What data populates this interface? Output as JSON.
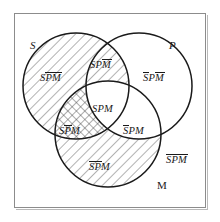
{
  "figure": {
    "type": "venn-diagram-3-set",
    "background_color": "#ffffff",
    "frame_color": "#8c8c8c",
    "stroke_color": "#1a1a1a",
    "hatch_color": "#555555"
  },
  "circles": [
    {
      "id": "S",
      "label": "S",
      "label_x": 30,
      "label_y": 40,
      "cx": 76,
      "cy": 86,
      "r": 53
    },
    {
      "id": "P",
      "label": "P",
      "label_x": 169,
      "label_y": 40,
      "cx": 139,
      "cy": 86,
      "r": 53
    },
    {
      "id": "M",
      "label": "M",
      "label_x": 157,
      "label_y": 180,
      "cx": 108,
      "cy": 134,
      "r": 53
    }
  ],
  "regions": [
    {
      "id": "S-only",
      "parts": [
        "S",
        "P-bar",
        "M-bar"
      ],
      "bars": [
        false,
        true,
        true
      ],
      "shading": "diagonal-hatch",
      "label_x": 40,
      "label_y": 73
    },
    {
      "id": "S-and-P",
      "parts": [
        "S",
        "P",
        "M-bar"
      ],
      "bars": [
        false,
        false,
        true
      ],
      "shading": "diagonal-hatch",
      "label_x": 90,
      "label_y": 60
    },
    {
      "id": "P-only",
      "parts": [
        "S",
        "P",
        "M-bar"
      ],
      "bars": [
        true,
        false,
        true
      ],
      "shading": "none",
      "label_x": 143,
      "label_y": 73
    },
    {
      "id": "S-and-P-and-M",
      "parts": [
        "S",
        "P",
        "M"
      ],
      "bars": [
        false,
        false,
        false
      ],
      "shading": "none",
      "label_x": 92,
      "label_y": 104
    },
    {
      "id": "S-and-M",
      "parts": [
        "S",
        "P",
        "M"
      ],
      "bars": [
        false,
        true,
        false
      ],
      "shading": "cross-hatch",
      "label_x": 59,
      "label_y": 126
    },
    {
      "id": "P-and-M",
      "parts": [
        "S",
        "P",
        "M"
      ],
      "bars": [
        true,
        false,
        false
      ],
      "shading": "none",
      "label_x": 123,
      "label_y": 126
    },
    {
      "id": "M-only",
      "parts": [
        "S",
        "P",
        "M"
      ],
      "bars": [
        true,
        true,
        false
      ],
      "shading": "diagonal-hatch",
      "label_x": 89,
      "label_y": 162
    },
    {
      "id": "outside-all",
      "parts": [
        "S",
        "P",
        "M"
      ],
      "bars": [
        true,
        true,
        true
      ],
      "shading": "none",
      "label_x": 166,
      "label_y": 155
    }
  ]
}
